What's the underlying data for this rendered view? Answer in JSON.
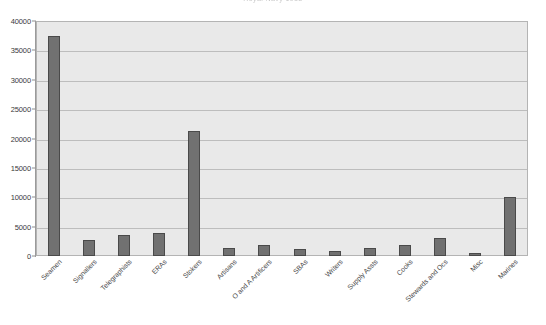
{
  "chart_data": {
    "type": "bar",
    "title": "Royal Navy 1918",
    "xlabel": "",
    "ylabel": "",
    "ylim": [
      0,
      40000
    ],
    "yticks": [
      0,
      5000,
      10000,
      15000,
      20000,
      25000,
      30000,
      35000,
      40000
    ],
    "ytick_labels": [
      "0",
      "5000",
      "10000",
      "15000",
      "20000",
      "25000",
      "30000",
      "35000",
      "40000"
    ],
    "grid": true,
    "legend": false,
    "bar_color": "#717171",
    "plot_background": "#e9e9e9",
    "categories": [
      "Seamen",
      "Signallers",
      "Telegraphists",
      "ERAs",
      "Stokers",
      "Artisans",
      "O and A Artificers",
      "SBAs",
      "Writers",
      "Supply Assts",
      "Cooks",
      "Stewards and Ocs",
      "Misc",
      "Marines"
    ],
    "values": [
      37400,
      2700,
      3500,
      3900,
      21200,
      1400,
      1800,
      1150,
      800,
      1300,
      1800,
      3100,
      500,
      10000
    ]
  }
}
